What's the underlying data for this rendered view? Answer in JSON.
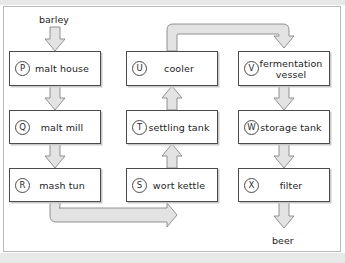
{
  "diagram": {
    "input_label": "barley",
    "output_label": "beer",
    "colors": {
      "box_border": "#4b4b4b",
      "arrow_fill": "#e3e3e3",
      "arrow_stroke": "#6e6e6e",
      "text": "#1d1d1d",
      "frame": "#b9b9b9",
      "page_band": "#e8e8e8"
    },
    "nodes": [
      {
        "tag": "P",
        "label": "malt house",
        "column": "left",
        "row": 1
      },
      {
        "tag": "Q",
        "label": "malt mill",
        "column": "left",
        "row": 2
      },
      {
        "tag": "R",
        "label": "mash tun",
        "column": "left",
        "row": 3
      },
      {
        "tag": "U",
        "label": "cooler",
        "column": "middle",
        "row": 1
      },
      {
        "tag": "T",
        "label": "settling tank",
        "column": "middle",
        "row": 2
      },
      {
        "tag": "S",
        "label": "wort kettle",
        "column": "middle",
        "row": 3
      },
      {
        "tag": "V",
        "label": "fermentation",
        "label2": "vessel",
        "column": "right",
        "row": 1
      },
      {
        "tag": "W",
        "label": "storage tank",
        "column": "right",
        "row": 2
      },
      {
        "tag": "X",
        "label": "filter",
        "column": "right",
        "row": 3
      }
    ],
    "flows": [
      {
        "from": "barley",
        "to": "malt house",
        "kind": "straight-down"
      },
      {
        "from": "malt house",
        "to": "malt mill",
        "kind": "straight-down"
      },
      {
        "from": "malt mill",
        "to": "mash tun",
        "kind": "straight-down"
      },
      {
        "from": "mash tun",
        "to": "wort kettle",
        "kind": "down-right-up"
      },
      {
        "from": "wort kettle",
        "to": "settling tank",
        "kind": "straight-up"
      },
      {
        "from": "settling tank",
        "to": "cooler",
        "kind": "straight-up"
      },
      {
        "from": "cooler",
        "to": "fermentation vessel",
        "kind": "up-right-down"
      },
      {
        "from": "fermentation vessel",
        "to": "storage tank",
        "kind": "straight-down"
      },
      {
        "from": "storage tank",
        "to": "filter",
        "kind": "straight-down"
      },
      {
        "from": "filter",
        "to": "beer",
        "kind": "straight-down"
      }
    ]
  }
}
